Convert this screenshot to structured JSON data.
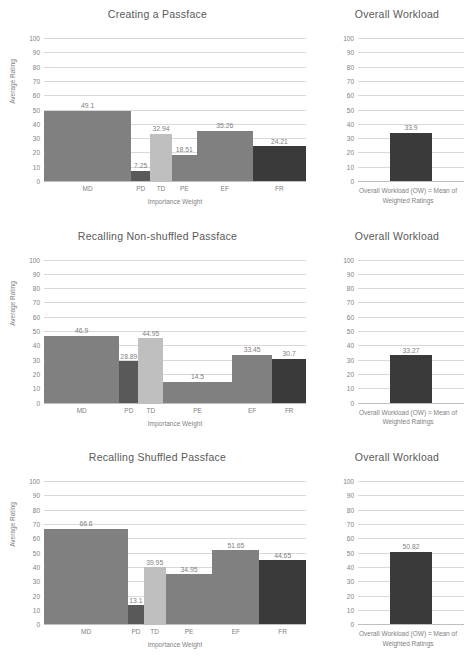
{
  "figure": {
    "y_axis_title": "Average Rating",
    "x_axis_title": "Importance Weight",
    "y_ticks": [
      "100",
      "90",
      "80",
      "70",
      "60",
      "50",
      "40",
      "30",
      "20",
      "10",
      "0"
    ],
    "ow_title": "Overall Workload",
    "ow_footnote_line1": "Overall Workload (OW) = Mean of",
    "ow_footnote_line2": "Weighted Ratings",
    "colors": {
      "md": "#808080",
      "pd": "#595959",
      "td": "#bfbfbf",
      "pe": "#808080",
      "ef": "#808080",
      "fr": "#3a3a3a",
      "ow": "#3a3a3a",
      "grid": "#d9d9d9",
      "text": "#7f7f7f",
      "title": "#595959"
    }
  },
  "chart_data": [
    {
      "type": "bar",
      "title": "Creating a Passface",
      "xlabel": "Importance Weight",
      "ylabel": "Average Rating",
      "ylim": [
        0,
        100
      ],
      "grid": true,
      "categories": [
        "MD",
        "PD",
        "TD",
        "PE",
        "EF",
        "FR"
      ],
      "values": [
        49.1,
        7.25,
        32.94,
        18.51,
        35.26,
        24.21
      ],
      "labels": [
        "49.1",
        "7.25",
        "32.94",
        "18.51",
        "35.26",
        "24.21"
      ],
      "widths": [
        0.333,
        0.072,
        0.083,
        0.095,
        0.214,
        0.203
      ],
      "bar_colors": [
        "#808080",
        "#595959",
        "#bfbfbf",
        "#808080",
        "#808080",
        "#3a3a3a"
      ],
      "overall_workload": {
        "title": "Overall Workload",
        "value": 33.9,
        "label": "33.9",
        "ylim": [
          0,
          100
        ],
        "footnote": "Overall Workload (OW) = Mean of Weighted Ratings"
      }
    },
    {
      "type": "bar",
      "title": "Recalling  Non-shuffled Passface",
      "xlabel": "Importance Weight",
      "ylabel": "Average Rating",
      "ylim": [
        0,
        100
      ],
      "grid": true,
      "categories": [
        "MD",
        "PD",
        "TD",
        "PE",
        "EF",
        "FR"
      ],
      "values": [
        46.9,
        28.89,
        44.95,
        14.5,
        33.45,
        30.7
      ],
      "labels": [
        "46.9",
        "28.89",
        "44.95",
        "14.5",
        "33.45",
        "30.7"
      ],
      "widths": [
        0.288,
        0.072,
        0.095,
        0.262,
        0.155,
        0.128
      ],
      "bar_colors": [
        "#808080",
        "#595959",
        "#bfbfbf",
        "#808080",
        "#808080",
        "#3a3a3a"
      ],
      "overall_workload": {
        "title": "Overall Workload",
        "value": 33.27,
        "label": "33.27",
        "ylim": [
          0,
          100
        ],
        "footnote": "Overall Workload (OW) = Mean of Weighted Ratings"
      }
    },
    {
      "type": "bar",
      "title": "Recalling  Shuffled Passface",
      "xlabel": "Importance Weight",
      "ylabel": "Average Rating",
      "ylim": [
        0,
        100
      ],
      "grid": true,
      "categories": [
        "MD",
        "PD",
        "TD",
        "PE",
        "EF",
        "FR"
      ],
      "values": [
        66.6,
        13.1,
        39.95,
        34.95,
        51.65,
        44.65
      ],
      "labels": [
        "66.6",
        "13.1",
        "39.95",
        "34.95",
        "51.65",
        "44.65"
      ],
      "widths": [
        0.321,
        0.06,
        0.083,
        0.179,
        0.179,
        0.178
      ],
      "bar_colors": [
        "#808080",
        "#595959",
        "#bfbfbf",
        "#808080",
        "#808080",
        "#3a3a3a"
      ],
      "overall_workload": {
        "title": "Overall Workload",
        "value": 50.82,
        "label": "50.82",
        "ylim": [
          0,
          100
        ],
        "footnote": "Overall Workload (OW) = Mean of Weighted Ratings"
      }
    }
  ]
}
